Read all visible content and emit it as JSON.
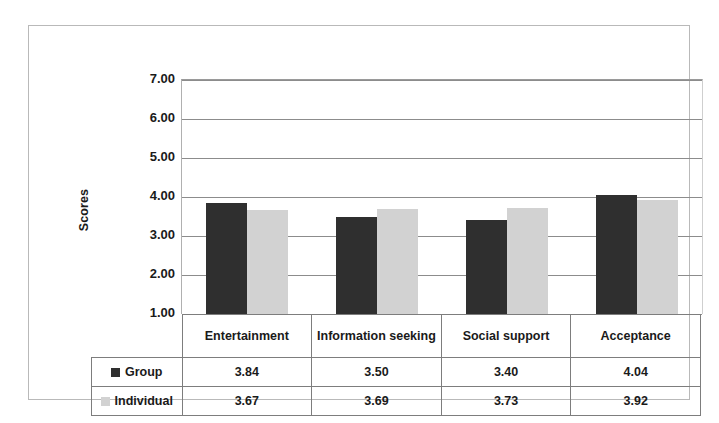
{
  "chart_data": {
    "type": "bar",
    "title": "",
    "xlabel": "",
    "ylabel": "Scores",
    "categories": [
      "Entertainment",
      "Information seeking",
      "Social support",
      "Acceptance"
    ],
    "series": [
      {
        "name": "Group",
        "values": [
          3.84,
          3.5,
          3.4,
          4.04
        ],
        "color": "#2f2f2f"
      },
      {
        "name": "Individual",
        "values": [
          3.67,
          3.69,
          3.73,
          3.92
        ],
        "color": "#d2d2d2"
      }
    ],
    "ylim": [
      1.0,
      7.0
    ],
    "ytick_labels": [
      "7.00",
      "6.00",
      "5.00",
      "4.00",
      "3.00",
      "2.00",
      "1.00"
    ],
    "ytick_values": [
      7.0,
      6.0,
      5.0,
      4.0,
      3.0,
      2.0,
      1.0
    ],
    "grid": true,
    "legend_position": "data-table",
    "data_table_shown": true
  },
  "axis": {
    "y_title": "Scores",
    "ticks": [
      {
        "label": "7.00"
      },
      {
        "label": "6.00"
      },
      {
        "label": "5.00"
      },
      {
        "label": "4.00"
      },
      {
        "label": "3.00"
      },
      {
        "label": "2.00"
      },
      {
        "label": "1.00"
      }
    ]
  },
  "table": {
    "headers": [
      "Entertainment",
      "Information seeking",
      "Social support",
      "Acceptance"
    ],
    "rows": [
      {
        "label": "Group",
        "values": [
          "3.84",
          "3.50",
          "3.40",
          "4.04"
        ]
      },
      {
        "label": "Individual",
        "values": [
          "3.67",
          "3.69",
          "3.73",
          "3.92"
        ]
      }
    ]
  }
}
